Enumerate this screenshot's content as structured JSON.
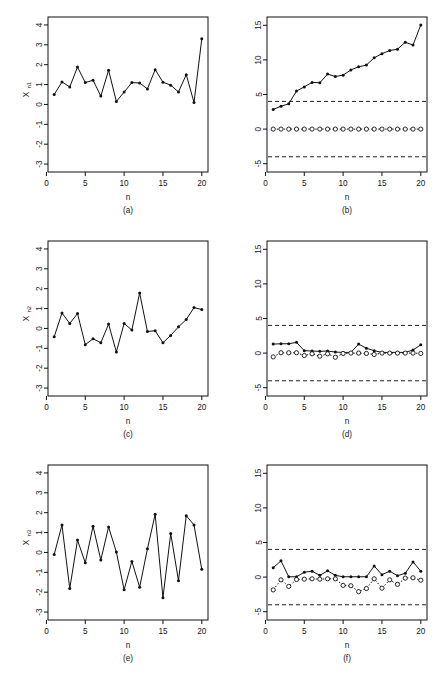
{
  "figure": {
    "background": "#ffffff",
    "line_color": "#111111",
    "limit_color": "#222222",
    "panel_count": 6,
    "caption": ""
  },
  "axis": {
    "xlabel": "n",
    "x_ticks": [
      0,
      5,
      10,
      15,
      20
    ],
    "left_y_ticks": [
      -3,
      -2,
      -1,
      0,
      1,
      2,
      3,
      4
    ],
    "right_y_ticks": [
      -5,
      0,
      5,
      10,
      15
    ],
    "x_range": [
      0.2,
      20.8
    ],
    "left_y_range": [
      -3.4,
      4.4
    ],
    "right_y_range": [
      -6.2,
      16.2
    ]
  },
  "panels": [
    {
      "letter": "(a)",
      "ylabel": "X",
      "ysub": "n1",
      "position": "top-left"
    },
    {
      "letter": "(b)",
      "ylabel": "",
      "ysub": "",
      "position": "top-right"
    },
    {
      "letter": "(c)",
      "ylabel": "X",
      "ysub": "n2",
      "position": "middle-left"
    },
    {
      "letter": "(d)",
      "ylabel": "",
      "ysub": "",
      "position": "middle-right"
    },
    {
      "letter": "(e)",
      "ylabel": "X",
      "ysub": "n3",
      "position": "bottom-left"
    },
    {
      "letter": "(f)",
      "ylabel": "",
      "ysub": "",
      "position": "bottom-right"
    }
  ],
  "chart_data": [
    {
      "id": "panel-a",
      "type": "line",
      "title": "",
      "panel_letter": "(a)",
      "xlabel": "n",
      "ylabel": "X_n1",
      "xlim": [
        0.2,
        20.8
      ],
      "ylim": [
        -3.4,
        4.4
      ],
      "xticks": [
        0,
        5,
        10,
        15,
        20
      ],
      "yticks": [
        -3,
        -2,
        -1,
        0,
        1,
        2,
        3,
        4
      ],
      "grid": false,
      "legend": "none",
      "marker": "filled-circle",
      "x": [
        1,
        2,
        3,
        4,
        5,
        6,
        7,
        8,
        9,
        10,
        11,
        12,
        13,
        14,
        15,
        16,
        17,
        18,
        19,
        20
      ],
      "values": [
        0.5,
        1.13,
        0.88,
        1.88,
        1.1,
        1.22,
        0.42,
        1.72,
        0.15,
        0.62,
        1.1,
        1.08,
        0.78,
        1.75,
        1.12,
        0.97,
        0.63,
        1.5,
        0.1,
        3.3
      ]
    },
    {
      "id": "panel-b",
      "type": "line",
      "title": "",
      "panel_letter": "(b)",
      "xlabel": "n",
      "ylabel": "",
      "xlim": [
        0.2,
        20.8
      ],
      "ylim": [
        -6.2,
        16.2
      ],
      "xticks": [
        0,
        5,
        10,
        15,
        20
      ],
      "yticks": [
        -5,
        0,
        5,
        10,
        15
      ],
      "grid": false,
      "legend": "none",
      "control_limits": [
        4.0,
        -4.0
      ],
      "control_limit_style": "dashed",
      "x": [
        1,
        2,
        3,
        4,
        5,
        6,
        7,
        8,
        9,
        10,
        11,
        12,
        13,
        14,
        15,
        16,
        17,
        18,
        19,
        20
      ],
      "series": [
        {
          "name": "upper-cusum",
          "marker": "filled-circle",
          "linestyle": "solid",
          "values": [
            2.85,
            3.3,
            3.65,
            5.5,
            6.1,
            6.75,
            6.7,
            7.95,
            7.6,
            7.8,
            8.55,
            9.0,
            9.25,
            10.3,
            10.9,
            11.35,
            11.55,
            12.55,
            12.15,
            15.05
          ]
        },
        {
          "name": "lower-cusum",
          "marker": "open-circle",
          "linestyle": "dotted",
          "values": [
            0,
            0,
            0,
            0,
            0,
            0,
            0,
            0,
            0,
            0,
            0,
            0,
            0,
            0,
            0,
            0,
            0,
            0,
            0,
            0
          ]
        }
      ]
    },
    {
      "id": "panel-c",
      "type": "line",
      "title": "",
      "panel_letter": "(c)",
      "xlabel": "n",
      "ylabel": "X_n2",
      "xlim": [
        0.2,
        20.8
      ],
      "ylim": [
        -3.4,
        4.4
      ],
      "xticks": [
        0,
        5,
        10,
        15,
        20
      ],
      "yticks": [
        -3,
        -2,
        -1,
        0,
        1,
        2,
        3,
        4
      ],
      "grid": false,
      "legend": "none",
      "marker": "filled-circle",
      "x": [
        1,
        2,
        3,
        4,
        5,
        6,
        7,
        8,
        9,
        10,
        11,
        12,
        13,
        14,
        15,
        16,
        17,
        18,
        19,
        20
      ],
      "values": [
        -0.42,
        0.78,
        0.25,
        0.75,
        -0.82,
        -0.52,
        -0.72,
        0.22,
        -1.18,
        0.25,
        -0.08,
        1.78,
        -0.15,
        -0.12,
        -0.72,
        -0.35,
        0.08,
        0.45,
        1.05,
        0.95
      ]
    },
    {
      "id": "panel-d",
      "type": "line",
      "title": "",
      "panel_letter": "(d)",
      "xlabel": "n",
      "ylabel": "",
      "xlim": [
        0.2,
        20.8
      ],
      "ylim": [
        -6.2,
        16.2
      ],
      "xticks": [
        0,
        5,
        10,
        15,
        20
      ],
      "yticks": [
        -5,
        0,
        5,
        10,
        15
      ],
      "grid": false,
      "legend": "none",
      "control_limits": [
        4.0,
        -4.0
      ],
      "control_limit_style": "dashed",
      "x": [
        1,
        2,
        3,
        4,
        5,
        6,
        7,
        8,
        9,
        10,
        11,
        12,
        13,
        14,
        15,
        16,
        17,
        18,
        19,
        20
      ],
      "series": [
        {
          "name": "upper-cusum",
          "marker": "filled-circle",
          "linestyle": "solid",
          "values": [
            1.3,
            1.35,
            1.35,
            1.55,
            0.35,
            0.3,
            0.25,
            0.3,
            0.15,
            0.1,
            0.1,
            1.3,
            0.7,
            0.35,
            0.1,
            0.1,
            0.1,
            0.1,
            0.45,
            1.2
          ]
        },
        {
          "name": "lower-cusum",
          "marker": "open-circle",
          "linestyle": "dotted",
          "values": [
            -0.55,
            0.05,
            0.05,
            0.05,
            -0.35,
            -0.1,
            -0.45,
            -0.1,
            -0.6,
            -0.05,
            0.0,
            0.0,
            -0.05,
            -0.2,
            0.0,
            0.0,
            0.0,
            0.0,
            0.0,
            -0.05
          ]
        }
      ]
    },
    {
      "id": "panel-e",
      "type": "line",
      "title": "",
      "panel_letter": "(e)",
      "xlabel": "n",
      "ylabel": "X_n3",
      "xlim": [
        0.2,
        20.8
      ],
      "ylim": [
        -3.4,
        4.4
      ],
      "xticks": [
        0,
        5,
        10,
        15,
        20
      ],
      "yticks": [
        -3,
        -2,
        -1,
        0,
        1,
        2,
        3,
        4
      ],
      "grid": false,
      "legend": "none",
      "marker": "filled-circle",
      "x": [
        1,
        2,
        3,
        4,
        5,
        6,
        7,
        8,
        9,
        10,
        11,
        12,
        13,
        14,
        15,
        16,
        17,
        18,
        19,
        20
      ],
      "values": [
        -0.1,
        1.38,
        -1.82,
        0.62,
        -0.52,
        1.32,
        -0.38,
        1.28,
        0.02,
        -1.88,
        -0.45,
        -1.75,
        0.18,
        1.92,
        -2.28,
        0.95,
        -1.42,
        1.85,
        1.38,
        -0.85
      ]
    },
    {
      "id": "panel-f",
      "type": "line",
      "title": "",
      "panel_letter": "(f)",
      "xlabel": "n",
      "ylabel": "",
      "xlim": [
        0.2,
        20.8
      ],
      "ylim": [
        -6.2,
        16.2
      ],
      "xticks": [
        0,
        5,
        10,
        15,
        20
      ],
      "yticks": [
        -5,
        0,
        5,
        10,
        15
      ],
      "grid": false,
      "legend": "none",
      "control_limits": [
        4.0,
        -4.0
      ],
      "control_limit_style": "dashed",
      "x": [
        1,
        2,
        3,
        4,
        5,
        6,
        7,
        8,
        9,
        10,
        11,
        12,
        13,
        14,
        15,
        16,
        17,
        18,
        19,
        20
      ],
      "series": [
        {
          "name": "upper-cusum",
          "marker": "filled-circle",
          "linestyle": "solid",
          "values": [
            1.35,
            2.35,
            0.05,
            0.05,
            0.7,
            0.85,
            0.25,
            0.9,
            0.25,
            0.05,
            0.05,
            0.05,
            0.05,
            1.6,
            0.35,
            0.85,
            0.2,
            0.55,
            2.2,
            0.85
          ]
        },
        {
          "name": "lower-cusum",
          "marker": "open-circle",
          "linestyle": "dotted",
          "values": [
            -1.85,
            -0.4,
            -1.35,
            -0.35,
            -0.3,
            -0.25,
            -0.3,
            -0.25,
            -0.25,
            -1.2,
            -1.25,
            -2.1,
            -1.65,
            -0.25,
            -1.6,
            -0.4,
            -1.05,
            -0.15,
            -0.1,
            -0.45
          ]
        }
      ]
    }
  ]
}
